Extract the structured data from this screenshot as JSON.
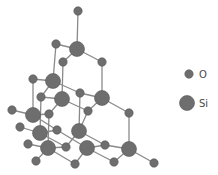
{
  "diagram": {
    "title": "",
    "colors": {
      "atom_fill": "#6e6e6e",
      "atom_stroke": "#555555",
      "bond": "#8a8a8a"
    },
    "atoms": [
      {
        "id": "o1",
        "type": "O",
        "x": 78,
        "y": 11
      },
      {
        "id": "si1",
        "type": "Si",
        "x": 77,
        "y": 49
      },
      {
        "id": "o2",
        "type": "O",
        "x": 56,
        "y": 44
      },
      {
        "id": "o3",
        "type": "O",
        "x": 63,
        "y": 62
      },
      {
        "id": "o4",
        "type": "O",
        "x": 102,
        "y": 62
      },
      {
        "id": "si2",
        "type": "Si",
        "x": 53,
        "y": 81
      },
      {
        "id": "o5",
        "type": "O",
        "x": 33,
        "y": 79
      },
      {
        "id": "o6",
        "type": "O",
        "x": 80,
        "y": 93
      },
      {
        "id": "si3",
        "type": "Si",
        "x": 62,
        "y": 99
      },
      {
        "id": "si4",
        "type": "Si",
        "x": 102,
        "y": 98
      },
      {
        "id": "o7",
        "type": "O",
        "x": 41,
        "y": 97
      },
      {
        "id": "o8",
        "type": "O",
        "x": 88,
        "y": 111
      },
      {
        "id": "o9",
        "type": "O",
        "x": 129,
        "y": 113
      },
      {
        "id": "o10",
        "type": "O",
        "x": 12,
        "y": 110
      },
      {
        "id": "si5",
        "type": "Si",
        "x": 33,
        "y": 115
      },
      {
        "id": "o11",
        "type": "O",
        "x": 49,
        "y": 114
      },
      {
        "id": "o12",
        "type": "O",
        "x": 20,
        "y": 127
      },
      {
        "id": "si6",
        "type": "Si",
        "x": 40,
        "y": 133
      },
      {
        "id": "o13",
        "type": "O",
        "x": 57,
        "y": 130
      },
      {
        "id": "si7",
        "type": "Si",
        "x": 79,
        "y": 131
      },
      {
        "id": "o14",
        "type": "O",
        "x": 28,
        "y": 144
      },
      {
        "id": "si8",
        "type": "Si",
        "x": 48,
        "y": 148
      },
      {
        "id": "o15",
        "type": "O",
        "x": 66,
        "y": 147
      },
      {
        "id": "si9",
        "type": "Si",
        "x": 87,
        "y": 148
      },
      {
        "id": "o16",
        "type": "O",
        "x": 105,
        "y": 145
      },
      {
        "id": "si10",
        "type": "Si",
        "x": 129,
        "y": 149
      },
      {
        "id": "o17",
        "type": "O",
        "x": 36,
        "y": 161
      },
      {
        "id": "o18",
        "type": "O",
        "x": 75,
        "y": 164
      },
      {
        "id": "o19",
        "type": "O",
        "x": 114,
        "y": 162
      },
      {
        "id": "o20",
        "type": "O",
        "x": 154,
        "y": 163
      }
    ],
    "bonds": [
      [
        "o1",
        "si1"
      ],
      [
        "si1",
        "o2"
      ],
      [
        "si1",
        "o3"
      ],
      [
        "si1",
        "o4"
      ],
      [
        "o2",
        "si2"
      ],
      [
        "o3",
        "si3"
      ],
      [
        "o4",
        "si4"
      ],
      [
        "si2",
        "o5"
      ],
      [
        "si2",
        "o6"
      ],
      [
        "si2",
        "o7"
      ],
      [
        "o6",
        "si4"
      ],
      [
        "o6",
        "si7"
      ],
      [
        "si3",
        "o7"
      ],
      [
        "si3",
        "o8"
      ],
      [
        "si3",
        "o11"
      ],
      [
        "si4",
        "o8"
      ],
      [
        "si4",
        "o9"
      ],
      [
        "o5",
        "si5"
      ],
      [
        "o10",
        "si5"
      ],
      [
        "si5",
        "o11"
      ],
      [
        "si5",
        "o13"
      ],
      [
        "o7",
        "si6"
      ],
      [
        "o12",
        "si6"
      ],
      [
        "si6",
        "o13"
      ],
      [
        "si6",
        "o15"
      ],
      [
        "o11",
        "si8"
      ],
      [
        "o8",
        "si7"
      ],
      [
        "si7",
        "o15"
      ],
      [
        "si7",
        "o16"
      ],
      [
        "o14",
        "si8"
      ],
      [
        "si8",
        "o15"
      ],
      [
        "si8",
        "o17"
      ],
      [
        "si8",
        "o18"
      ],
      [
        "o13",
        "si9"
      ],
      [
        "si9",
        "o18"
      ],
      [
        "si9",
        "o16"
      ],
      [
        "si9",
        "o19"
      ],
      [
        "o9",
        "si10"
      ],
      [
        "si10",
        "o19"
      ],
      [
        "si10",
        "o20"
      ],
      [
        "o16",
        "si10"
      ]
    ],
    "radii": {
      "O": 4.2,
      "Si": 7.5
    }
  },
  "legend": {
    "items": [
      {
        "symbol": "O",
        "label": "O",
        "x": 189,
        "y": 74,
        "label_x": 199
      },
      {
        "symbol": "Si",
        "label": "Si",
        "x": 187,
        "y": 103,
        "label_x": 199
      }
    ]
  }
}
